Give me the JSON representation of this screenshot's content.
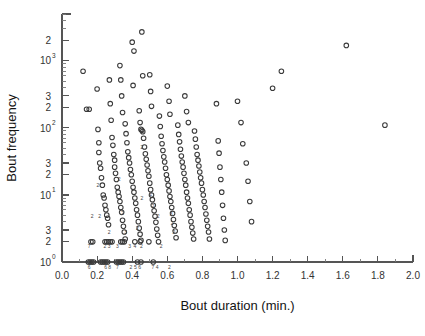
{
  "chart_data": {
    "type": "scatter",
    "title": "",
    "xlabel": "Bout duration (min.)",
    "ylabel": "Bout frequency",
    "xscale": "linear",
    "yscale": "log",
    "xlim": [
      0.0,
      2.0
    ],
    "ylim": [
      1,
      5000
    ],
    "grid": false,
    "legend": null,
    "marker": "open-circle",
    "xticks": [
      0.0,
      0.2,
      0.4,
      0.6,
      0.8,
      1.0,
      1.2,
      1.4,
      1.6,
      1.8,
      2.0
    ],
    "xtick_labels": [
      "0.0",
      "0.2",
      "0.4",
      "0.6",
      "0.8",
      "1.0",
      "1.2",
      "1.4",
      "1.6",
      "1.8",
      "2.0"
    ],
    "x_minor_ticks": [
      0.1,
      0.3,
      0.5,
      0.7,
      0.9,
      1.1,
      1.3,
      1.5,
      1.7,
      1.9
    ],
    "yticks": [
      1,
      2,
      3,
      10,
      20,
      30,
      100,
      200,
      300,
      1000,
      2000,
      10000
    ],
    "ytick_labels": [
      {
        "value": 1,
        "text": "10",
        "sup": "0"
      },
      {
        "value": 2,
        "text": "2",
        "sup": ""
      },
      {
        "value": 3,
        "text": "3",
        "sup": ""
      },
      {
        "value": 10,
        "text": "10",
        "sup": "1"
      },
      {
        "value": 20,
        "text": "2",
        "sup": ""
      },
      {
        "value": 30,
        "text": "3",
        "sup": ""
      },
      {
        "value": 100,
        "text": "10",
        "sup": "2"
      },
      {
        "value": 200,
        "text": "2",
        "sup": ""
      },
      {
        "value": 300,
        "text": "3",
        "sup": ""
      },
      {
        "value": 1000,
        "text": "10",
        "sup": "3"
      },
      {
        "value": 2000,
        "text": "2",
        "sup": ""
      },
      {
        "value": 10000,
        "text": "",
        "sup": "4"
      }
    ],
    "points": [
      [
        0.12,
        700
      ],
      [
        0.14,
        190
      ],
      [
        0.155,
        190
      ],
      [
        0.2,
        380
      ],
      [
        0.205,
        95
      ],
      [
        0.21,
        60
      ],
      [
        0.21,
        43
      ],
      [
        0.215,
        30
      ],
      [
        0.22,
        25
      ],
      [
        0.225,
        18
      ],
      [
        0.23,
        14
      ],
      [
        0.235,
        10
      ],
      [
        0.24,
        9
      ],
      [
        0.245,
        7
      ],
      [
        0.25,
        6
      ],
      [
        0.255,
        5
      ],
      [
        0.26,
        4.5
      ],
      [
        0.265,
        3.6
      ],
      [
        0.27,
        520
      ],
      [
        0.275,
        230
      ],
      [
        0.28,
        130
      ],
      [
        0.285,
        72
      ],
      [
        0.29,
        55
      ],
      [
        0.295,
        40
      ],
      [
        0.3,
        33
      ],
      [
        0.3,
        26
      ],
      [
        0.305,
        21
      ],
      [
        0.31,
        17
      ],
      [
        0.315,
        13
      ],
      [
        0.32,
        11
      ],
      [
        0.325,
        9.5
      ],
      [
        0.33,
        8
      ],
      [
        0.335,
        6.5
      ],
      [
        0.34,
        5.5
      ],
      [
        0.345,
        4.2
      ],
      [
        0.35,
        3.4
      ],
      [
        0.355,
        2.8
      ],
      [
        0.36,
        2.2
      ],
      [
        0.33,
        850
      ],
      [
        0.335,
        520
      ],
      [
        0.34,
        300
      ],
      [
        0.345,
        170
      ],
      [
        0.36,
        115
      ],
      [
        0.365,
        82
      ],
      [
        0.37,
        60
      ],
      [
        0.375,
        44
      ],
      [
        0.38,
        36
      ],
      [
        0.385,
        30
      ],
      [
        0.39,
        24
      ],
      [
        0.395,
        20
      ],
      [
        0.4,
        16
      ],
      [
        0.405,
        13
      ],
      [
        0.41,
        11
      ],
      [
        0.415,
        9
      ],
      [
        0.42,
        7.5
      ],
      [
        0.425,
        6
      ],
      [
        0.43,
        5
      ],
      [
        0.435,
        4
      ],
      [
        0.44,
        3.2
      ],
      [
        0.445,
        2.6
      ],
      [
        0.45,
        2.1
      ],
      [
        0.4,
        1900
      ],
      [
        0.41,
        1400
      ],
      [
        0.405,
        430
      ],
      [
        0.455,
        2700
      ],
      [
        0.46,
        600
      ],
      [
        0.44,
        180
      ],
      [
        0.445,
        120
      ],
      [
        0.45,
        95
      ],
      [
        0.455,
        92
      ],
      [
        0.46,
        88
      ],
      [
        0.465,
        70
      ],
      [
        0.47,
        52
      ],
      [
        0.475,
        41
      ],
      [
        0.48,
        34
      ],
      [
        0.485,
        28
      ],
      [
        0.49,
        23
      ],
      [
        0.495,
        19
      ],
      [
        0.5,
        15
      ],
      [
        0.505,
        12
      ],
      [
        0.51,
        10
      ],
      [
        0.515,
        8.5
      ],
      [
        0.52,
        7
      ],
      [
        0.525,
        5.8
      ],
      [
        0.53,
        4.8
      ],
      [
        0.535,
        3.9
      ],
      [
        0.54,
        3.1
      ],
      [
        0.545,
        2.5
      ],
      [
        0.55,
        2.0
      ],
      [
        0.5,
        620
      ],
      [
        0.505,
        350
      ],
      [
        0.51,
        210
      ],
      [
        0.555,
        150
      ],
      [
        0.56,
        105
      ],
      [
        0.565,
        75
      ],
      [
        0.57,
        58
      ],
      [
        0.575,
        46
      ],
      [
        0.58,
        37
      ],
      [
        0.585,
        31
      ],
      [
        0.59,
        25
      ],
      [
        0.595,
        20
      ],
      [
        0.6,
        17
      ],
      [
        0.605,
        14
      ],
      [
        0.61,
        11.5
      ],
      [
        0.615,
        9.5
      ],
      [
        0.62,
        8
      ],
      [
        0.625,
        6.5
      ],
      [
        0.63,
        5.3
      ],
      [
        0.635,
        4.3
      ],
      [
        0.64,
        3.5
      ],
      [
        0.645,
        2.9
      ],
      [
        0.65,
        2.3
      ],
      [
        0.6,
        420
      ],
      [
        0.61,
        250
      ],
      [
        0.615,
        160
      ],
      [
        0.66,
        110
      ],
      [
        0.665,
        80
      ],
      [
        0.67,
        62
      ],
      [
        0.675,
        48
      ],
      [
        0.68,
        38
      ],
      [
        0.685,
        31
      ],
      [
        0.69,
        26
      ],
      [
        0.695,
        21
      ],
      [
        0.7,
        17
      ],
      [
        0.705,
        14
      ],
      [
        0.71,
        11
      ],
      [
        0.715,
        9
      ],
      [
        0.72,
        7.5
      ],
      [
        0.725,
        6
      ],
      [
        0.73,
        5
      ],
      [
        0.735,
        4
      ],
      [
        0.74,
        3.3
      ],
      [
        0.745,
        2.7
      ],
      [
        0.75,
        2.2
      ],
      [
        0.7,
        300
      ],
      [
        0.71,
        175
      ],
      [
        0.72,
        120
      ],
      [
        0.755,
        90
      ],
      [
        0.76,
        68
      ],
      [
        0.765,
        52
      ],
      [
        0.77,
        40
      ],
      [
        0.775,
        33
      ],
      [
        0.78,
        27
      ],
      [
        0.785,
        22
      ],
      [
        0.79,
        18
      ],
      [
        0.795,
        15
      ],
      [
        0.8,
        12
      ],
      [
        0.805,
        10
      ],
      [
        0.81,
        8
      ],
      [
        0.815,
        6.5
      ],
      [
        0.82,
        5.2
      ],
      [
        0.825,
        4.2
      ],
      [
        0.83,
        3.4
      ],
      [
        0.835,
        2.8
      ],
      [
        0.84,
        2.2
      ],
      [
        0.88,
        230
      ],
      [
        0.89,
        64
      ],
      [
        0.895,
        42
      ],
      [
        0.9,
        26
      ],
      [
        0.905,
        17
      ],
      [
        0.91,
        11
      ],
      [
        0.915,
        7
      ],
      [
        0.92,
        4.5
      ],
      [
        0.925,
        3.0
      ],
      [
        0.93,
        2.1
      ],
      [
        1.0,
        250
      ],
      [
        1.02,
        120
      ],
      [
        1.03,
        58
      ],
      [
        1.05,
        30
      ],
      [
        1.06,
        16
      ],
      [
        1.07,
        8
      ],
      [
        1.08,
        4
      ],
      [
        1.2,
        390
      ],
      [
        1.25,
        700
      ],
      [
        1.62,
        1700
      ],
      [
        1.84,
        110
      ],
      [
        0.15,
        1.0
      ],
      [
        0.16,
        1.0
      ],
      [
        0.17,
        1.0
      ],
      [
        0.18,
        1.0
      ],
      [
        0.22,
        1.0
      ],
      [
        0.23,
        1.0
      ],
      [
        0.24,
        1.0
      ],
      [
        0.25,
        1.0
      ],
      [
        0.26,
        1.0
      ],
      [
        0.31,
        1.0
      ],
      [
        0.32,
        1.0
      ],
      [
        0.33,
        1.0
      ],
      [
        0.34,
        1.0
      ],
      [
        0.35,
        1.0
      ],
      [
        0.43,
        1.0
      ],
      [
        0.45,
        1.0
      ],
      [
        0.52,
        1.0
      ],
      [
        0.165,
        2.0
      ],
      [
        0.175,
        2.0
      ],
      [
        0.245,
        2.0
      ],
      [
        0.255,
        2.0
      ],
      [
        0.265,
        2.0
      ],
      [
        0.275,
        2.0
      ],
      [
        0.285,
        2.0
      ],
      [
        0.335,
        2.0
      ],
      [
        0.345,
        2.0
      ],
      [
        0.355,
        2.0
      ],
      [
        0.415,
        2.0
      ],
      [
        0.445,
        2.0
      ],
      [
        0.495,
        2.0
      ]
    ],
    "count_annotations": [
      {
        "x": 0.155,
        "y": 1.62,
        "text": "7"
      },
      {
        "x": 0.245,
        "y": 1.62,
        "text": "2"
      },
      {
        "x": 0.268,
        "y": 1.62,
        "text": "3"
      },
      {
        "x": 0.315,
        "y": 1.62,
        "text": "3"
      },
      {
        "x": 0.385,
        "y": 1.62,
        "text": "3"
      },
      {
        "x": 0.415,
        "y": 1.62,
        "text": "4"
      },
      {
        "x": 0.452,
        "y": 1.62,
        "text": "2"
      },
      {
        "x": 0.565,
        "y": 1.62,
        "text": "2"
      },
      {
        "x": 0.155,
        "y": 0.8,
        "text": "6"
      },
      {
        "x": 0.248,
        "y": 0.8,
        "text": "6"
      },
      {
        "x": 0.272,
        "y": 0.8,
        "text": "8"
      },
      {
        "x": 0.315,
        "y": 0.8,
        "text": "7"
      },
      {
        "x": 0.392,
        "y": 0.8,
        "text": "2"
      },
      {
        "x": 0.418,
        "y": 0.8,
        "text": "5"
      },
      {
        "x": 0.442,
        "y": 0.8,
        "text": "6"
      },
      {
        "x": 0.518,
        "y": 0.8,
        "text": "7"
      },
      {
        "x": 0.542,
        "y": 0.8,
        "text": "4"
      },
      {
        "x": 0.612,
        "y": 0.8,
        "text": "2"
      },
      {
        "x": 0.205,
        "y": 13.0,
        "text": "2"
      },
      {
        "x": 0.325,
        "y": 16.0,
        "text": "2"
      },
      {
        "x": 0.455,
        "y": 48.0,
        "text": "2"
      },
      {
        "x": 0.172,
        "y": 4.6,
        "text": "2"
      },
      {
        "x": 0.215,
        "y": 4.6,
        "text": "2"
      },
      {
        "x": 0.345,
        "y": 5.0,
        "text": "2"
      },
      {
        "x": 0.505,
        "y": 9.5,
        "text": "2"
      },
      {
        "x": 0.52,
        "y": 6.5,
        "text": "2"
      },
      {
        "x": 0.548,
        "y": 4.5,
        "text": "2"
      },
      {
        "x": 0.622,
        "y": 4.8,
        "text": "3"
      },
      {
        "x": 0.628,
        "y": 3.6,
        "text": "2"
      },
      {
        "x": 0.638,
        "y": 2.6,
        "text": "2"
      },
      {
        "x": 0.268,
        "y": 2.6,
        "text": "2"
      },
      {
        "x": 0.362,
        "y": 2.6,
        "text": "3"
      },
      {
        "x": 0.455,
        "y": 8.5,
        "text": "2"
      },
      {
        "x": 0.43,
        "y": 3.0,
        "text": "2"
      }
    ]
  },
  "axis_titles": {
    "x": "Bout duration (min.)",
    "y": "Bout frequency"
  }
}
